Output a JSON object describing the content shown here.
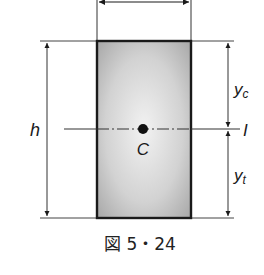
{
  "figure": {
    "caption": "図 5・24",
    "labels": {
      "height": "h",
      "centroid": "C",
      "y_c_main": "y",
      "y_c_sub": "c",
      "y_t_main": "y",
      "y_t_sub": "t",
      "axis": "I"
    },
    "colors": {
      "stroke": "#1a1a1a",
      "fill_center": "#f2f2f2",
      "fill_edge": "#a8a8a8"
    }
  }
}
